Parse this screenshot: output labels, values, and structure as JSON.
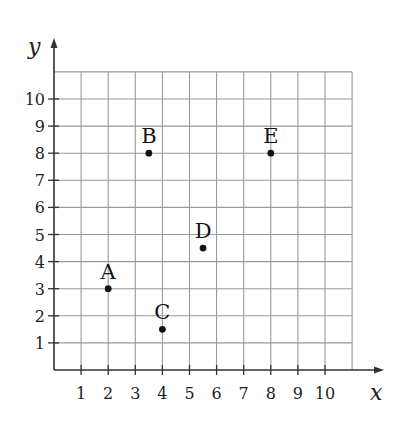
{
  "chart_data": {
    "type": "scatter",
    "title": "",
    "xlabel": "x",
    "ylabel": "y",
    "xlim": [
      0,
      11
    ],
    "ylim": [
      0,
      11
    ],
    "grid": true,
    "x_ticks": [
      "1",
      "2",
      "3",
      "4",
      "5",
      "6",
      "7",
      "8",
      "9",
      "10"
    ],
    "y_ticks": [
      "1",
      "2",
      "3",
      "4",
      "5",
      "6",
      "7",
      "8",
      "9",
      "10"
    ],
    "points": [
      {
        "label": "A",
        "x": 2,
        "y": 3
      },
      {
        "label": "B",
        "x": 3.5,
        "y": 8
      },
      {
        "label": "C",
        "x": 4,
        "y": 1.5
      },
      {
        "label": "D",
        "x": 5.5,
        "y": 4.5
      },
      {
        "label": "E",
        "x": 8,
        "y": 8
      }
    ]
  },
  "colors": {
    "grid": "#9a9a9a",
    "axis": "#333333",
    "point": "#111111"
  }
}
